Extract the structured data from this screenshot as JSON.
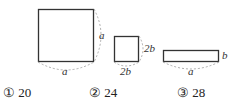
{
  "figures": [
    {
      "name": "square-a",
      "side_labels": {
        "right": "a",
        "bottom": "a"
      }
    },
    {
      "name": "square-2b",
      "side_labels": {
        "right": "2b",
        "bottom": "2b"
      }
    },
    {
      "name": "rectangle-a-b",
      "side_labels": {
        "right": "b",
        "bottom": "a"
      }
    }
  ],
  "options": [
    {
      "marker": "①",
      "value": "20"
    },
    {
      "marker": "②",
      "value": "24"
    },
    {
      "marker": "③",
      "value": "28"
    }
  ]
}
